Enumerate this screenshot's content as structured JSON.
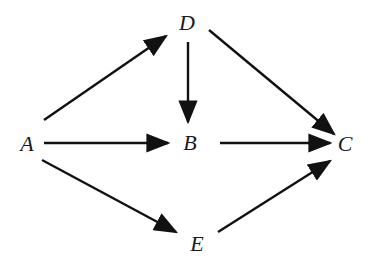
{
  "diagram": {
    "type": "directed-graph",
    "colors": {
      "edge": "#111111",
      "label": "#1a1a1a",
      "background": "#ffffff"
    },
    "nodes": [
      {
        "id": "A",
        "label": "A",
        "x": 27,
        "y": 151
      },
      {
        "id": "B",
        "label": "B",
        "x": 190,
        "y": 150
      },
      {
        "id": "C",
        "label": "C",
        "x": 345,
        "y": 151
      },
      {
        "id": "D",
        "label": "D",
        "x": 187,
        "y": 30
      },
      {
        "id": "E",
        "label": "E",
        "x": 197,
        "y": 251
      }
    ],
    "edges": [
      {
        "from": "A",
        "to": "D",
        "x1": 44,
        "y1": 120,
        "x2": 166,
        "y2": 36
      },
      {
        "from": "D",
        "to": "B",
        "x1": 188,
        "y1": 42,
        "x2": 188,
        "y2": 122
      },
      {
        "from": "D",
        "to": "C",
        "x1": 209,
        "y1": 30,
        "x2": 334,
        "y2": 134
      },
      {
        "from": "A",
        "to": "B",
        "x1": 44,
        "y1": 143,
        "x2": 168,
        "y2": 143
      },
      {
        "from": "B",
        "to": "C",
        "x1": 220,
        "y1": 143,
        "x2": 330,
        "y2": 143
      },
      {
        "from": "A",
        "to": "E",
        "x1": 42,
        "y1": 160,
        "x2": 176,
        "y2": 232
      },
      {
        "from": "E",
        "to": "C",
        "x1": 218,
        "y1": 232,
        "x2": 330,
        "y2": 161
      }
    ]
  }
}
